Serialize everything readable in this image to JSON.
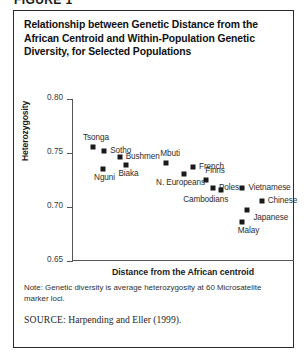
{
  "figure_label": "FIGURE 1",
  "figure": {
    "title": "Relationship between Genetic Distance from the African Centroid and Within-Population Genetic Diversity, for Selected Populations",
    "note": "Note: Genetic diversity is average heterozygosity at 60 Microsatelite marker loci.",
    "source_keyword": "SOURCE:",
    "source_text": "Harpending and Eller (1999)."
  },
  "chart_data": {
    "type": "scatter",
    "title": "Relationship between Genetic Distance from the African Centroid and Within-Population Genetic Diversity, for Selected Populations",
    "xlabel": "Distance from the African centroid",
    "ylabel": "Heterozygosity",
    "grid": false,
    "legend": "none",
    "ylim": [
      0.65,
      0.8
    ],
    "yticks": [
      "0.80",
      "0.75",
      "0.70",
      "0.65"
    ],
    "ytick_values": [
      0.8,
      0.75,
      0.7,
      0.65
    ],
    "xlim": [
      0,
      1
    ],
    "xticks": [],
    "points": [
      {
        "label": "Tsonga",
        "x": 0.095,
        "y": 0.756,
        "label_dx": -10,
        "label_dy": -14
      },
      {
        "label": "Sotho",
        "x": 0.145,
        "y": 0.752,
        "label_dx": 6,
        "label_dy": -5
      },
      {
        "label": "Bushmen",
        "x": 0.215,
        "y": 0.746,
        "label_dx": 6,
        "label_dy": -5
      },
      {
        "label": "Nguni",
        "x": 0.14,
        "y": 0.735,
        "label_dx": -9,
        "label_dy": 4
      },
      {
        "label": "Biaka",
        "x": 0.245,
        "y": 0.739,
        "label_dx": -8,
        "label_dy": 4
      },
      {
        "label": "Mbuti",
        "x": 0.425,
        "y": 0.741,
        "label_dx": -6,
        "label_dy": -14
      },
      {
        "label": "N. Europeans",
        "x": 0.505,
        "y": 0.731,
        "label_dx": -28,
        "label_dy": 4
      },
      {
        "label": "French",
        "x": 0.545,
        "y": 0.737,
        "label_dx": 6,
        "label_dy": -5
      },
      {
        "label": "Finns",
        "x": 0.605,
        "y": 0.725,
        "label_dx": -1,
        "label_dy": -14
      },
      {
        "label": "Poles",
        "x": 0.635,
        "y": 0.718,
        "label_dx": 6,
        "label_dy": -5
      },
      {
        "label": "Cambodians",
        "x": 0.672,
        "y": 0.716,
        "label_dx": -38,
        "label_dy": 5
      },
      {
        "label": "Vietnamese",
        "x": 0.768,
        "y": 0.718,
        "label_dx": 6,
        "label_dy": -5
      },
      {
        "label": "Chinese",
        "x": 0.855,
        "y": 0.706,
        "label_dx": 6,
        "label_dy": -5
      },
      {
        "label": "Japanese",
        "x": 0.79,
        "y": 0.697,
        "label_dx": 6,
        "label_dy": 3
      },
      {
        "label": "Malay",
        "x": 0.765,
        "y": 0.686,
        "label_dx": -4,
        "label_dy": 4
      }
    ]
  }
}
